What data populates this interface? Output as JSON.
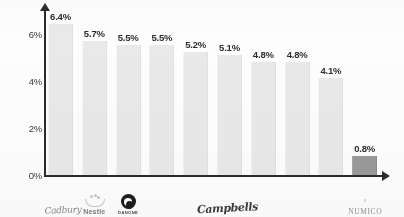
{
  "chart_data": {
    "type": "bar",
    "title": "",
    "subtitle": "",
    "xlabel": "",
    "ylabel": "",
    "ylim": [
      0,
      7
    ],
    "grid": false,
    "legend": "none",
    "ytick_labels": [
      "0%",
      "2%",
      "4%",
      "6%"
    ],
    "ytick_values": [
      0,
      2,
      4,
      6
    ],
    "categories": [
      "Cadbury",
      "Nestle",
      "Danone",
      "",
      "Campbell's",
      "",
      "",
      "",
      "",
      "NUMICO"
    ],
    "values": [
      6.4,
      5.7,
      5.5,
      5.5,
      5.2,
      5.1,
      4.8,
      4.8,
      4.1,
      0.8
    ],
    "data_labels": [
      "6.4%",
      "5.7%",
      "5.5%",
      "5.5%",
      "5.2%",
      "5.1%",
      "4.8%",
      "4.8%",
      "4.1%",
      "0.8%"
    ],
    "bar_colors": [
      "#e9e9e9",
      "#e9e9e9",
      "#e9e9e9",
      "#e9e9e9",
      "#e9e9e9",
      "#e9e9e9",
      "#e9e9e9",
      "#e9e9e9",
      "#e9e9e9",
      "#9a9a9a"
    ],
    "highlight_index": 9,
    "axis_color": "#2b2b2b"
  },
  "axis": {
    "y_ticks": [
      {
        "label": "6%",
        "value": 6
      },
      {
        "label": "4%",
        "value": 4
      },
      {
        "label": "2%",
        "value": 2
      },
      {
        "label": "0%",
        "value": 0
      }
    ]
  },
  "bars": [
    {
      "label": "6.4%",
      "value": 6.4,
      "highlight": false
    },
    {
      "label": "5.7%",
      "value": 5.7,
      "highlight": false
    },
    {
      "label": "5.5%",
      "value": 5.5,
      "highlight": false
    },
    {
      "label": "5.5%",
      "value": 5.5,
      "highlight": false
    },
    {
      "label": "5.2%",
      "value": 5.2,
      "highlight": false
    },
    {
      "label": "5.1%",
      "value": 5.1,
      "highlight": false
    },
    {
      "label": "4.8%",
      "value": 4.8,
      "highlight": false
    },
    {
      "label": "4.8%",
      "value": 4.8,
      "highlight": false
    },
    {
      "label": "4.1%",
      "value": 4.1,
      "highlight": false
    },
    {
      "label": "0.8%",
      "value": 0.8,
      "highlight": true
    }
  ],
  "logos": {
    "cadbury": {
      "text": "Cadbury",
      "slot": 0,
      "kind": "cadbury-script"
    },
    "nestle": {
      "text": "Nestle",
      "slot": 1,
      "kind": "nestle-nest"
    },
    "danone": {
      "text": "DANONE",
      "slot": 2,
      "kind": "danone-circle"
    },
    "campbells": {
      "text": "Campbells",
      "slot": 4,
      "kind": "campbells-script"
    },
    "numico": {
      "text": "NUMICO",
      "mark": "°",
      "slot": 9,
      "kind": "numico-wordmark"
    }
  }
}
